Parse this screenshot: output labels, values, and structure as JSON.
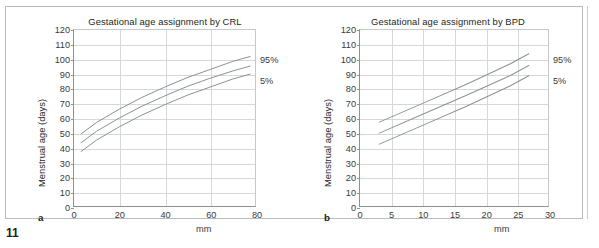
{
  "page": {
    "page_number": "11"
  },
  "figure": {
    "panels": [
      {
        "letter": "a",
        "title": "Gestational age assignment by CRL",
        "ylabel": "Menstrual age (days)",
        "xunit": "mm",
        "labels": {
          "upper": "95%",
          "lower": "5%"
        }
      },
      {
        "letter": "b",
        "title": "Gestational age assignment by BPD",
        "ylabel": "Menstrual age (days)",
        "xunit": "mm",
        "labels": {
          "upper": "95%",
          "lower": "5%"
        }
      }
    ]
  },
  "chart_data": [
    {
      "type": "line",
      "title": "Gestational age assignment by CRL",
      "xlabel": "mm",
      "ylabel": "Menstrual age (days)",
      "xlim": [
        0,
        80
      ],
      "ylim": [
        0,
        120
      ],
      "xticks": [
        0,
        20,
        40,
        60,
        80
      ],
      "yticks": [
        0,
        10,
        20,
        30,
        40,
        50,
        60,
        70,
        80,
        90,
        100,
        110,
        120
      ],
      "grid": true,
      "legend_position": "right-of-axes",
      "line_color": "#8d9195",
      "x": [
        3,
        10,
        20,
        30,
        40,
        50,
        60,
        70,
        78
      ],
      "series": [
        {
          "name": "95%",
          "values": [
            49,
            57,
            66,
            74,
            81,
            87.5,
            93,
            98.5,
            102
          ]
        },
        {
          "name": "50%",
          "values": [
            43,
            51,
            60,
            68,
            75,
            81.5,
            87,
            92,
            95.5
          ]
        },
        {
          "name": "5%",
          "values": [
            37,
            45,
            54,
            62,
            69,
            75.5,
            81,
            86.5,
            90
          ]
        }
      ]
    },
    {
      "type": "line",
      "title": "Gestational age assignment by BPD",
      "xlabel": "mm",
      "ylabel": "Menstrual age (days)",
      "xlim": [
        0,
        30
      ],
      "ylim": [
        0,
        120
      ],
      "xticks": [
        0,
        5,
        10,
        15,
        20,
        25,
        30
      ],
      "yticks": [
        0,
        10,
        20,
        30,
        40,
        50,
        60,
        70,
        80,
        90,
        100,
        110,
        120
      ],
      "grid": true,
      "legend_position": "right-of-axes",
      "line_color": "#8d9195",
      "x": [
        3,
        10,
        17,
        24,
        27
      ],
      "series": [
        {
          "name": "95%",
          "values": [
            57,
            70,
            83,
            97,
            104
          ]
        },
        {
          "name": "50%",
          "values": [
            49.5,
            62.5,
            75.5,
            89,
            96
          ]
        },
        {
          "name": "5%",
          "values": [
            42,
            55,
            68,
            82,
            89
          ]
        }
      ]
    }
  ]
}
